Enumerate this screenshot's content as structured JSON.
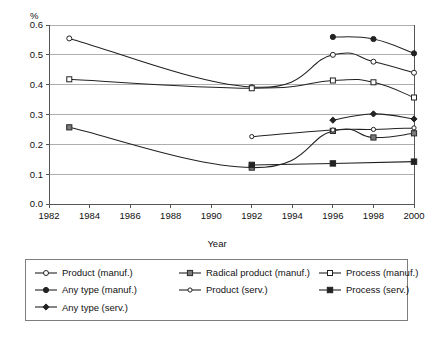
{
  "chart_data": {
    "type": "line",
    "title": "",
    "xlabel": "Year",
    "ylabel": "%",
    "xlim": [
      1982,
      2000
    ],
    "ylim": [
      0.0,
      0.6
    ],
    "xticks": [
      1982,
      1984,
      1986,
      1988,
      1990,
      1992,
      1994,
      1996,
      1998,
      2000
    ],
    "yticks": [
      "0.0",
      "0.1",
      "0.2",
      "0.3",
      "0.4",
      "0.5",
      "0.6"
    ],
    "grid": "horizontal",
    "legend_position": "below-plot",
    "legend_columns": 3,
    "series": [
      {
        "name": "Product (manuf.)",
        "marker": "open-circle",
        "color": "#222222",
        "x": [
          1983,
          1992,
          1996,
          1998,
          2000
        ],
        "values": [
          0.555,
          0.392,
          0.5,
          0.477,
          0.44
        ]
      },
      {
        "name": "Radical product (manuf.)",
        "marker": "grey-square",
        "color": "#222222",
        "x": [
          1983,
          1992,
          1996,
          1998,
          2000
        ],
        "values": [
          0.257,
          0.122,
          0.245,
          0.223,
          0.237
        ]
      },
      {
        "name": "Process (manuf.)",
        "marker": "open-square",
        "color": "#222222",
        "x": [
          1983,
          1992,
          1996,
          1998,
          2000
        ],
        "values": [
          0.418,
          0.388,
          0.414,
          0.408,
          0.357
        ]
      },
      {
        "name": "Any type (manuf.)",
        "marker": "filled-circle",
        "color": "#222222",
        "x": [
          1996,
          1998,
          2000
        ],
        "values": [
          0.56,
          0.553,
          0.505
        ]
      },
      {
        "name": "Product (serv.)",
        "marker": "small-circle",
        "color": "#222222",
        "x": [
          1992,
          1996,
          1998,
          2000
        ],
        "values": [
          0.226,
          0.248,
          0.25,
          0.255
        ]
      },
      {
        "name": "Process (serv.)",
        "marker": "filled-square",
        "color": "#222222",
        "x": [
          1992,
          1996,
          2000
        ],
        "values": [
          0.131,
          0.136,
          0.142
        ]
      },
      {
        "name": "Any type (serv.)",
        "marker": "filled-diamond",
        "color": "#222222",
        "x": [
          1996,
          1998,
          2000
        ],
        "values": [
          0.281,
          0.302,
          0.285
        ]
      }
    ]
  },
  "legend": {
    "entries": [
      {
        "label": "Product (manuf.)",
        "marker": "open-circle"
      },
      {
        "label": "Radical product (manuf.)",
        "marker": "grey-square"
      },
      {
        "label": "Process (manuf.)",
        "marker": "open-square"
      },
      {
        "label": "Any type (manuf.)",
        "marker": "filled-circle"
      },
      {
        "label": "Product (serv.)",
        "marker": "small-circle"
      },
      {
        "label": "Process (serv.)",
        "marker": "filled-square"
      },
      {
        "label": "Any type (serv.)",
        "marker": "filled-diamond"
      }
    ]
  }
}
